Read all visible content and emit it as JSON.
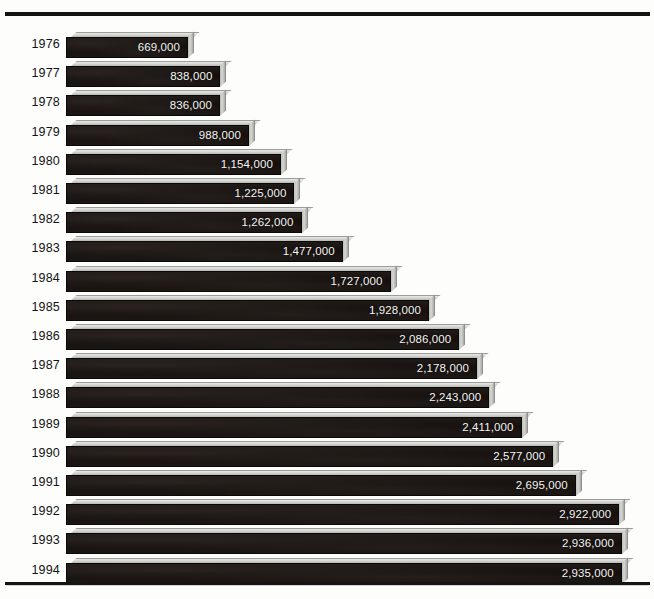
{
  "chart_data": {
    "type": "bar",
    "orientation": "horizontal",
    "title": "",
    "subtitle": "",
    "xlabel": "",
    "ylabel": "",
    "grid": false,
    "legend": null,
    "legend_position": "none",
    "value_label_format": "comma-separated integer",
    "xlim": [
      0,
      2936000
    ],
    "categories": [
      "1976",
      "1977",
      "1978",
      "1979",
      "1980",
      "1981",
      "1982",
      "1983",
      "1984",
      "1985",
      "1986",
      "1987",
      "1988",
      "1989",
      "1990",
      "1991",
      "1992",
      "1993",
      "1994"
    ],
    "values": [
      669000,
      838000,
      836000,
      988000,
      1154000,
      1225000,
      1262000,
      1477000,
      1727000,
      1928000,
      2086000,
      2178000,
      2243000,
      2411000,
      2577000,
      2695000,
      2922000,
      2936000,
      2935000
    ],
    "value_labels": [
      "669,000",
      "838,000",
      "836,000",
      "988,000",
      "1,154,000",
      "1,225,000",
      "1,262,000",
      "1,477,000",
      "1,727,000",
      "1,928,000",
      "2,086,000",
      "2,178,000",
      "2,243,000",
      "2,411,000",
      "2,577,000",
      "2,695,000",
      "2,922,000",
      "2,936,000",
      "2,935,000"
    ]
  },
  "style": {
    "background": "#ffffff",
    "bar_front_color": "#15100e",
    "bar_highlight_color": "#d4d4d1",
    "value_text_color": "#f6f6f4",
    "axis_label_color": "#131313",
    "rule_color": "#141414"
  }
}
